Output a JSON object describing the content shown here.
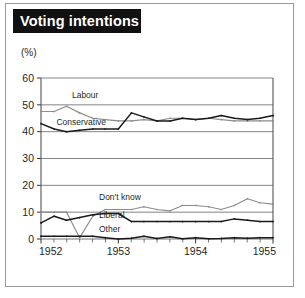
{
  "figure": {
    "title": "Voting intentions",
    "unit_label": "(%)"
  },
  "chart_data": {
    "type": "line",
    "title": "Voting intentions",
    "xlabel": "",
    "ylabel": "(%)",
    "unit_label": "(%)",
    "xlim": [
      1952.0,
      1955.0
    ],
    "ylim": [
      0,
      60
    ],
    "ytick_labels": [
      "0",
      "10",
      "20",
      "30",
      "40",
      "50",
      "60"
    ],
    "yticks": [
      0,
      10,
      20,
      30,
      40,
      50,
      60
    ],
    "xtick_labels": [
      "1952",
      "1953",
      "1954",
      "1955"
    ],
    "xticks": [
      1952,
      1953,
      1954,
      1955
    ],
    "minor_xticks_per_year": 6,
    "grid": "horizontal",
    "legend": "inline-labels",
    "x": [
      1952.0,
      1952.17,
      1952.33,
      1952.5,
      1952.67,
      1952.83,
      1953.0,
      1953.17,
      1953.33,
      1953.5,
      1953.67,
      1953.83,
      1954.0,
      1954.17,
      1954.33,
      1954.5,
      1954.67,
      1954.83,
      1955.0
    ],
    "series": [
      {
        "name": "Labour",
        "color": "#8c8c8c",
        "label_x": 1952.4,
        "label_y": 52.5,
        "values": [
          47.5,
          47.5,
          49.5,
          47.0,
          45.0,
          44.5,
          44.0,
          44.0,
          44.5,
          44.0,
          45.0,
          45.0,
          44.5,
          45.0,
          44.5,
          44.0,
          44.0,
          44.0,
          44.0
        ]
      },
      {
        "name": "Conservative",
        "color": "#1a1a1a",
        "label_x": 1952.2,
        "label_y": 42.5,
        "values": [
          43.0,
          41.0,
          40.0,
          40.5,
          41.0,
          41.0,
          41.0,
          47.0,
          45.5,
          44.0,
          44.0,
          45.0,
          44.5,
          45.0,
          46.0,
          45.0,
          44.5,
          45.0,
          46.0
        ]
      },
      {
        "name": "Don't know",
        "color": "#8c8c8c",
        "label_x": 1952.75,
        "label_y": 14.5,
        "values": [
          10.0,
          10.0,
          10.0,
          0.5,
          8.5,
          11.0,
          11.0,
          11.0,
          12.0,
          11.0,
          10.5,
          12.5,
          12.5,
          12.0,
          11.0,
          12.5,
          15.0,
          13.5,
          13.0
        ]
      },
      {
        "name": "Liberal",
        "color": "#1a1a1a",
        "label_x": 1952.75,
        "label_y": 8.0,
        "values": [
          6.0,
          8.5,
          7.0,
          8.0,
          9.0,
          9.5,
          9.5,
          6.5,
          6.5,
          6.5,
          6.5,
          6.5,
          6.5,
          6.5,
          6.5,
          7.5,
          7.0,
          6.5,
          6.5
        ]
      },
      {
        "name": "Other",
        "color": "#1a1a1a",
        "label_x": 1952.75,
        "label_y": 2.7,
        "values": [
          1.0,
          1.0,
          1.0,
          1.0,
          1.0,
          0.5,
          0.0,
          0.3,
          1.0,
          0.2,
          0.8,
          0.1,
          0.5,
          0.1,
          0.2,
          0.5,
          0.3,
          0.5,
          0.5
        ]
      }
    ]
  }
}
